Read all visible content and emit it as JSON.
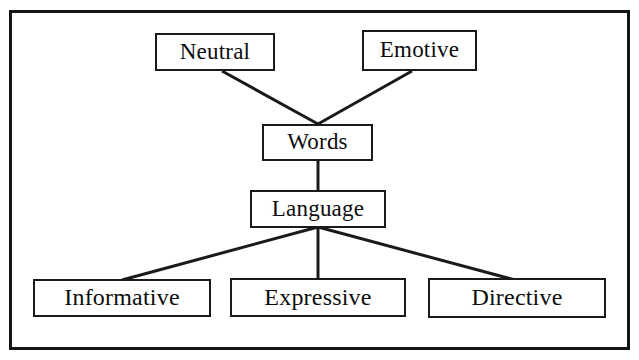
{
  "figure": {
    "type": "hierarchical-tree-diagram",
    "background_color": "#ffffff",
    "frame_color": "#151515",
    "line_color": "#1a1a1a",
    "text_color": "#0d0d0d"
  },
  "nodes": {
    "neutral": {
      "label": "Neutral"
    },
    "emotive": {
      "label": "Emotive"
    },
    "words": {
      "label": "Words"
    },
    "language": {
      "label": "Language"
    },
    "informative": {
      "label": "Informative"
    },
    "expressive": {
      "label": "Expressive"
    },
    "directive": {
      "label": "Directive"
    }
  },
  "edges": [
    {
      "from": "neutral",
      "to": "words"
    },
    {
      "from": "emotive",
      "to": "words"
    },
    {
      "from": "words",
      "to": "language"
    },
    {
      "from": "language",
      "to": "informative"
    },
    {
      "from": "language",
      "to": "expressive"
    },
    {
      "from": "language",
      "to": "directive"
    }
  ]
}
